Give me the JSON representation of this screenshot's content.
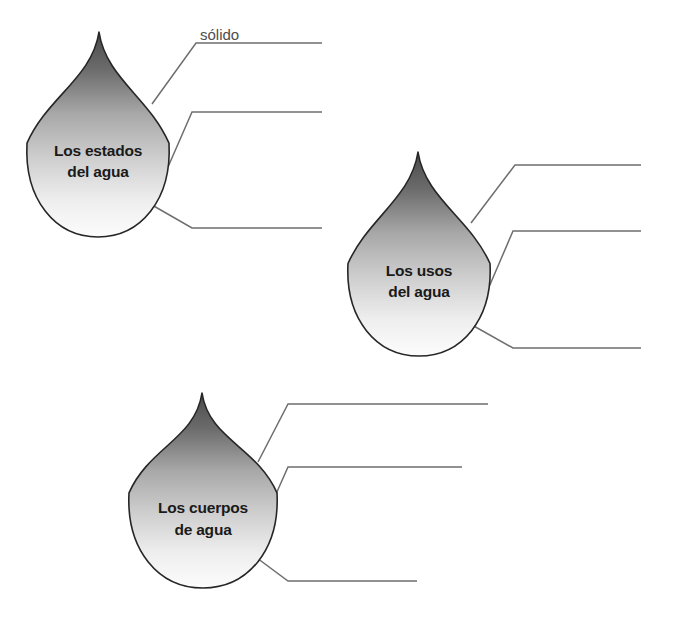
{
  "worksheet": {
    "type": "concept-map-worksheet",
    "language": "es",
    "background_color": "#ffffff",
    "width": 677,
    "height": 621,
    "outline_color": "#262626",
    "leader_line_color": "#6e6e6e",
    "title_text_color": "#1a1a1a",
    "answer_text_color": "#4d4d4d",
    "gradient": {
      "top_color": "#4a4a4a",
      "mid_color": "#bdbdbd",
      "bottom_color": "#fbfbfb"
    }
  },
  "droplets": [
    {
      "id": "estados",
      "title_line1": "Los estados",
      "title_line2": "del agua",
      "geometry": {
        "tip_x": 99,
        "tip_y": 32,
        "cx": 98,
        "cy": 168,
        "rx": 71,
        "ry": 69
      },
      "title_x": 98,
      "title_y1": 156,
      "title_y2": 177,
      "lines": [
        {
          "id": "estados-1",
          "answer": "sólido",
          "elbow_start_x": 152,
          "elbow_start_y": 104,
          "elbow_mid_x": 196,
          "elbow_mid_y": 43,
          "end_x": 322,
          "end_y": 43,
          "label_x": 200,
          "label_y": 40
        },
        {
          "id": "estados-2",
          "answer": "",
          "elbow_start_x": 168,
          "elbow_start_y": 167,
          "elbow_mid_x": 192,
          "elbow_mid_y": 112,
          "end_x": 322,
          "end_y": 112,
          "label_x": 196,
          "label_y": 109
        },
        {
          "id": "estados-3",
          "answer": "",
          "elbow_start_x": 152,
          "elbow_start_y": 205,
          "elbow_mid_x": 192,
          "elbow_mid_y": 228,
          "end_x": 322,
          "end_y": 228,
          "label_x": 196,
          "label_y": 225
        }
      ]
    },
    {
      "id": "usos",
      "title_line1": "Los usos",
      "title_line2": "del agua",
      "geometry": {
        "tip_x": 418,
        "tip_y": 152,
        "cx": 419,
        "cy": 288,
        "rx": 71,
        "ry": 68
      },
      "title_x": 419,
      "title_y1": 276,
      "title_y2": 297,
      "lines": [
        {
          "id": "usos-1",
          "answer": "",
          "elbow_start_x": 471,
          "elbow_start_y": 223,
          "elbow_mid_x": 515,
          "elbow_mid_y": 165,
          "end_x": 641,
          "end_y": 165,
          "label_x": 519,
          "label_y": 162
        },
        {
          "id": "usos-2",
          "answer": "",
          "elbow_start_x": 489,
          "elbow_start_y": 287,
          "elbow_mid_x": 513,
          "elbow_mid_y": 231,
          "end_x": 641,
          "end_y": 231,
          "label_x": 517,
          "label_y": 228
        },
        {
          "id": "usos-3",
          "answer": "",
          "elbow_start_x": 472,
          "elbow_start_y": 325,
          "elbow_mid_x": 513,
          "elbow_mid_y": 348,
          "end_x": 641,
          "end_y": 348,
          "label_x": 517,
          "label_y": 345
        }
      ]
    },
    {
      "id": "cuerpos",
      "title_line1": "Los cuerpos",
      "title_line2": "de agua",
      "geometry": {
        "tip_x": 202,
        "tip_y": 393,
        "cx": 203,
        "cy": 518,
        "rx": 74,
        "ry": 70
      },
      "title_x": 203,
      "title_y1": 513,
      "title_y2": 535,
      "lines": [
        {
          "id": "cuerpos-1",
          "answer": "",
          "elbow_start_x": 258,
          "elbow_start_y": 462,
          "elbow_mid_x": 288,
          "elbow_mid_y": 404,
          "end_x": 488,
          "end_y": 404,
          "label_x": 292,
          "label_y": 401
        },
        {
          "id": "cuerpos-2",
          "answer": "",
          "elbow_start_x": 272,
          "elbow_start_y": 503,
          "elbow_mid_x": 288,
          "elbow_mid_y": 467,
          "end_x": 462,
          "end_y": 467,
          "label_x": 292,
          "label_y": 464
        },
        {
          "id": "cuerpos-3",
          "answer": "",
          "elbow_start_x": 257,
          "elbow_start_y": 558,
          "elbow_mid_x": 288,
          "elbow_mid_y": 581,
          "end_x": 417,
          "end_y": 581,
          "label_x": 292,
          "label_y": 578
        }
      ]
    }
  ]
}
